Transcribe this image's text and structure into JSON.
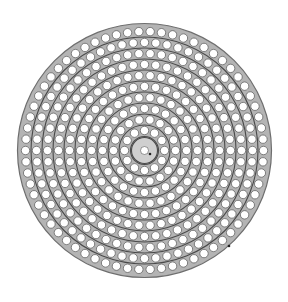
{
  "figure": {
    "width": 288,
    "height": 302,
    "center": [
      144.5,
      150.5
    ],
    "outer_radius": 127,
    "colors": {
      "background": "#ffffff",
      "plate_fill": "#b4b4b4",
      "plate_stroke": "#6e6e6e",
      "ring_line": "#4a4a4a",
      "hub_fill": "#cfcfcf",
      "hole_fill": "#ffffff",
      "hole_stroke": "#555555",
      "marker": "#222222"
    },
    "hub": {
      "radius": 13,
      "center_hole_radius": 4
    },
    "hole_radius": 4.2,
    "rings": [
      {
        "radius": 20,
        "holes": 12
      },
      {
        "radius": 31,
        "holes": 18
      },
      {
        "radius": 42,
        "holes": 24
      },
      {
        "radius": 53,
        "holes": 30
      },
      {
        "radius": 64,
        "holes": 36
      },
      {
        "radius": 75,
        "holes": 42
      },
      {
        "radius": 86,
        "holes": 48
      },
      {
        "radius": 97,
        "holes": 54
      },
      {
        "radius": 108,
        "holes": 60
      },
      {
        "radius": 119,
        "holes": 66
      }
    ],
    "separator_lines": [
      14,
      25.5,
      36.5,
      47.5,
      58.5,
      69.5,
      80.5,
      91.5,
      102.5,
      113.5
    ],
    "markers": [
      {
        "x": 150,
        "y": 154,
        "r": 1.3
      },
      {
        "x": 229,
        "y": 246,
        "r": 1.3
      }
    ]
  }
}
